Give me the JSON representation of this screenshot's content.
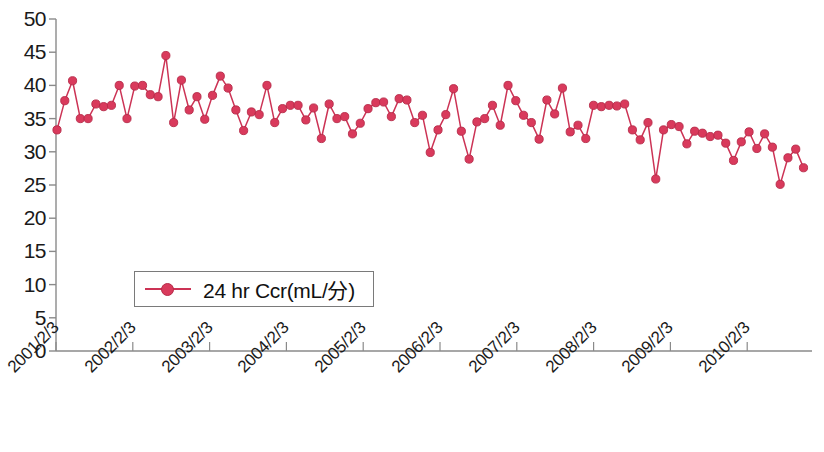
{
  "chart_data": {
    "type": "line",
    "title": "",
    "xlabel": "",
    "ylabel": "",
    "ylim": [
      0,
      50
    ],
    "ytick_step": 5,
    "yticks": [
      0,
      5,
      10,
      15,
      20,
      25,
      30,
      35,
      40,
      45,
      50
    ],
    "grid": false,
    "legend_position": "inside-lower-left",
    "series": [
      {
        "name": "24 hr Ccr(mL/分)",
        "color": "#cc3355",
        "marker": "circle",
        "values": [
          33.3,
          37.7,
          40.7,
          35.0,
          35.0,
          37.2,
          36.8,
          37.0,
          40.0,
          35.0,
          39.9,
          40.0,
          38.6,
          38.3,
          44.5,
          34.4,
          40.8,
          36.3,
          38.3,
          34.9,
          38.5,
          41.4,
          39.6,
          36.3,
          33.2,
          36.0,
          35.6,
          40.0,
          34.4,
          36.5,
          37.0,
          37.0,
          34.8,
          36.6,
          32.0,
          37.2,
          35.0,
          35.3,
          32.7,
          34.3,
          36.5,
          37.4,
          37.5,
          35.3,
          38.0,
          37.8,
          34.4,
          35.5,
          29.9,
          33.3,
          35.6,
          39.5,
          33.1,
          28.9,
          34.5,
          35.0,
          37.0,
          34.0,
          40.0,
          37.7,
          35.5,
          34.4,
          31.9,
          37.8,
          35.7,
          39.6,
          33.0,
          34.0,
          32.0,
          37.0,
          36.8,
          37.0,
          36.9,
          37.2,
          33.3,
          31.8,
          34.4,
          25.9,
          33.3,
          34.1,
          33.8,
          31.2,
          33.1,
          32.8,
          32.3,
          32.5,
          31.3,
          28.7,
          31.5,
          33.0,
          30.5,
          32.7,
          30.7,
          25.1,
          29.1,
          30.4,
          27.6
        ]
      }
    ],
    "x_tick_labels": [
      "2001/2/3",
      "2002/2/3",
      "2003/2/3",
      "2004/2/3",
      "2005/2/3",
      "2006/2/3",
      "2007/2/3",
      "2008/2/3",
      "2009/2/3",
      "2010/2/3"
    ]
  },
  "legend": {
    "label": "24 hr Ccr(mL/分)"
  },
  "colors": {
    "series": "#cc3355",
    "marker_fill": "#d93a5c",
    "marker_stroke": "#b52a48",
    "axis": "#8a8a8a",
    "text": "#1a1a1a"
  }
}
